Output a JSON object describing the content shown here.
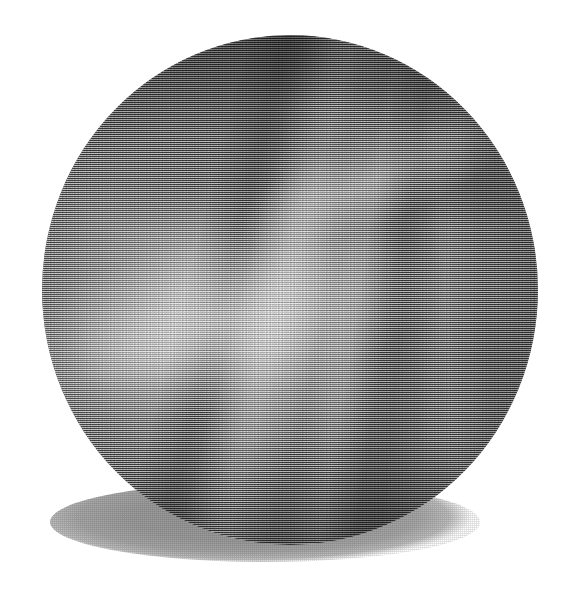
{
  "image": {
    "kind": "rendered-3d-sphere",
    "title": "Halftone shaded sphere",
    "description": "A grayscale sphere with a fine woven halftone dither texture, banded cloud-like markings across the upper hemisphere, and a soft elliptical drop shadow cast down and to the left.",
    "width": 569,
    "height": 592,
    "background_color": "#ffffff",
    "color_mode": "grayscale"
  },
  "sphere": {
    "name": "sphere",
    "label": "Shaded sphere",
    "center_x": 290,
    "center_y": 290,
    "width": 496,
    "height": 510,
    "bounds": {
      "left": 42,
      "top": 35,
      "right": 538,
      "bottom": 545
    },
    "highlight_position": "upper-left-of-center",
    "light_direction": "upper left",
    "tones": {
      "highlight": "#c9c9c9",
      "midtone": "#8d8d8d",
      "shade": "#6c6c6c",
      "terminator": "#4a4a4a",
      "rim": "#3f3f3f"
    },
    "texture": {
      "name": "halftone-weave",
      "label": "Halftone dither weave",
      "cell_size_px": 2,
      "pattern": "orthogonal crosshatch dots"
    },
    "bands": [
      {
        "name": "band-bright-upper-right",
        "tone": "light",
        "angle_deg": 104,
        "position": "upper right"
      },
      {
        "name": "band-dark-upper-right",
        "tone": "dark",
        "angle_deg": 104,
        "position": "upper right"
      },
      {
        "name": "band-bright-mid-right",
        "tone": "light",
        "angle_deg": 99,
        "position": "mid right"
      },
      {
        "name": "band-dark-mid",
        "tone": "dark",
        "angle_deg": 96,
        "position": "middle"
      },
      {
        "name": "band-bright-lower",
        "tone": "light",
        "angle_deg": 86,
        "position": "lower middle"
      }
    ],
    "highlights": [
      {
        "name": "primary-highlight",
        "x_pct": 34,
        "y_pct": 53,
        "intensity": 0.46
      },
      {
        "name": "secondary-highlight",
        "x_pct": 74,
        "y_pct": 36,
        "intensity": 0.4
      }
    ]
  },
  "shadow": {
    "name": "drop-shadow",
    "label": "Cast shadow ellipse",
    "shape": "ellipse",
    "left": 50,
    "top": 482,
    "width": 430,
    "height": 80,
    "color": "#9a9a9a",
    "offset": "down-left",
    "textured": true
  }
}
